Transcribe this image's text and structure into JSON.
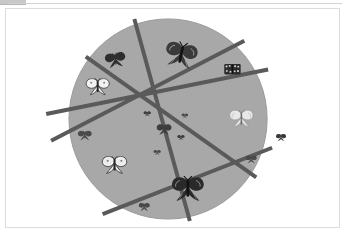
{
  "window": {
    "background_color": "#ffffff",
    "panel_border_color": "#dcdcdc",
    "top_strip_color": "#c8c8c8"
  },
  "figure": {
    "title": "",
    "caption": "",
    "canvas": {
      "width": 335,
      "height": 220
    },
    "circle": {
      "label": "gray circle",
      "cx": 163,
      "cy": 111,
      "rx": 100,
      "ry": 101,
      "fill_color": "#a8a8a8",
      "edge_color": "#9a9a9a"
    },
    "lines": {
      "label": "five dark chords forming a pentagram",
      "color": "#5a5a5a",
      "width": 4,
      "count": 5,
      "segments": [
        {
          "name": "chord-1",
          "x1": 129,
          "y1": 10,
          "x2": 185,
          "y2": 214
        },
        {
          "name": "chord-2",
          "x1": 80,
          "y1": 48,
          "x2": 252,
          "y2": 170
        },
        {
          "name": "chord-3",
          "x1": 40,
          "y1": 106,
          "x2": 264,
          "y2": 61
        },
        {
          "name": "chord-4",
          "x1": 45,
          "y1": 133,
          "x2": 240,
          "y2": 32
        },
        {
          "name": "chord-5",
          "x1": 97,
          "y1": 207,
          "x2": 268,
          "y2": 140
        }
      ]
    },
    "butterflies": [
      {
        "name": "butterfly-top-large-dark",
        "cx": 176,
        "cy": 47,
        "w": 34,
        "h": 42,
        "rot": 12,
        "style": "dark-detailed",
        "tone": "#3a3a3a"
      },
      {
        "name": "butterfly-upper-left-dark",
        "cx": 110,
        "cy": 52,
        "w": 24,
        "h": 16,
        "rot": -8,
        "style": "dark-solid",
        "tone": "#2e2e2e"
      },
      {
        "name": "butterfly-left-white",
        "cx": 92,
        "cy": 79,
        "w": 28,
        "h": 18,
        "rot": 0,
        "style": "white-outline",
        "tone": "#f2f2f2"
      },
      {
        "name": "butterfly-upper-right-patterned",
        "cx": 228,
        "cy": 61,
        "w": 18,
        "h": 16,
        "rot": 0,
        "style": "patterned",
        "tone": "#2b2b2b"
      },
      {
        "name": "butterfly-right-pale",
        "cx": 237,
        "cy": 111,
        "w": 26,
        "h": 26,
        "rot": 0,
        "style": "pale-detailed",
        "tone": "#e8e8e8"
      },
      {
        "name": "butterfly-far-left-small",
        "cx": 79,
        "cy": 128,
        "w": 15,
        "h": 11,
        "rot": 0,
        "style": "dark-solid",
        "tone": "#4a4a4a"
      },
      {
        "name": "butterfly-lower-left-moth",
        "cx": 109,
        "cy": 158,
        "w": 30,
        "h": 19,
        "rot": 0,
        "style": "white-outline",
        "tone": "#ededed"
      },
      {
        "name": "butterfly-bottom-large-dark",
        "cx": 183,
        "cy": 182,
        "w": 34,
        "h": 27,
        "rot": 0,
        "style": "dark-detailed",
        "tone": "#2a2a2a"
      },
      {
        "name": "butterfly-center",
        "cx": 159,
        "cy": 122,
        "w": 16,
        "h": 13,
        "rot": 0,
        "style": "dark-solid",
        "tone": "#3d3d3d"
      },
      {
        "name": "butterfly-center-upper-left",
        "cx": 142,
        "cy": 106,
        "w": 9,
        "h": 8,
        "rot": 0,
        "style": "tiny",
        "tone": "#3d3d3d"
      },
      {
        "name": "butterfly-center-upper-right",
        "cx": 180,
        "cy": 108,
        "w": 8,
        "h": 7,
        "rot": 0,
        "style": "tiny",
        "tone": "#4a4a4a"
      },
      {
        "name": "butterfly-center-right",
        "cx": 176,
        "cy": 130,
        "w": 9,
        "h": 8,
        "rot": 0,
        "style": "tiny",
        "tone": "#3d3d3d"
      },
      {
        "name": "butterfly-center-lower",
        "cx": 152,
        "cy": 145,
        "w": 9,
        "h": 8,
        "rot": 0,
        "style": "tiny",
        "tone": "#4a4a4a"
      },
      {
        "name": "butterfly-bottom-small",
        "cx": 139,
        "cy": 200,
        "w": 12,
        "h": 9,
        "rot": 0,
        "style": "dark-solid",
        "tone": "#4a4a4a"
      },
      {
        "name": "butterfly-lower-right-small",
        "cx": 247,
        "cy": 152,
        "w": 12,
        "h": 9,
        "rot": 0,
        "style": "dark-solid",
        "tone": "#4a4a4a"
      },
      {
        "name": "butterfly-outside-right",
        "cx": 277,
        "cy": 130,
        "w": 11,
        "h": 8,
        "rot": 0,
        "style": "dark-solid",
        "tone": "#3a3a3a"
      }
    ]
  }
}
